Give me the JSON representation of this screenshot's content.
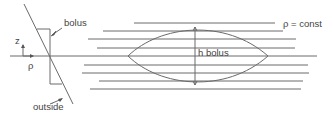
{
  "diagram": {
    "labels": {
      "bolus": "bolus",
      "z_axis": "z",
      "rho_axis": "ρ",
      "outside": "outside",
      "h_bolus": "h bolus",
      "rho_const": "ρ = const"
    },
    "line_color": "#6a6a6a",
    "text_color": "#444444"
  }
}
